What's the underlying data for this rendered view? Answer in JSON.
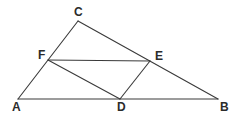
{
  "figure": {
    "width": 236,
    "height": 119,
    "background_color": "#ffffff",
    "line_color": "#3a3a3a",
    "label_color": "#2b2b2b"
  },
  "points": {
    "A": {
      "label": "A",
      "x": 18,
      "y": 99,
      "label_x": 12,
      "label_y": 101
    },
    "B": {
      "label": "B",
      "x": 218,
      "y": 99,
      "label_x": 220,
      "label_y": 101
    },
    "C": {
      "label": "C",
      "x": 78,
      "y": 21,
      "label_x": 74,
      "label_y": 6
    },
    "D": {
      "label": "D",
      "x": 120,
      "y": 99,
      "label_x": 117,
      "label_y": 101
    },
    "E": {
      "label": "E",
      "x": 150,
      "y": 61,
      "label_x": 155,
      "label_y": 50
    },
    "F": {
      "label": "F",
      "x": 48,
      "y": 60,
      "label_x": 38,
      "label_y": 49
    }
  },
  "segments": [
    {
      "name": "segment-AB",
      "from": "A",
      "to": "B"
    },
    {
      "name": "segment-AC",
      "from": "A",
      "to": "C"
    },
    {
      "name": "segment-CB",
      "from": "C",
      "to": "B"
    },
    {
      "name": "segment-FE",
      "from": "F",
      "to": "E"
    },
    {
      "name": "segment-FD",
      "from": "F",
      "to": "D"
    },
    {
      "name": "segment-ED",
      "from": "E",
      "to": "D"
    }
  ]
}
